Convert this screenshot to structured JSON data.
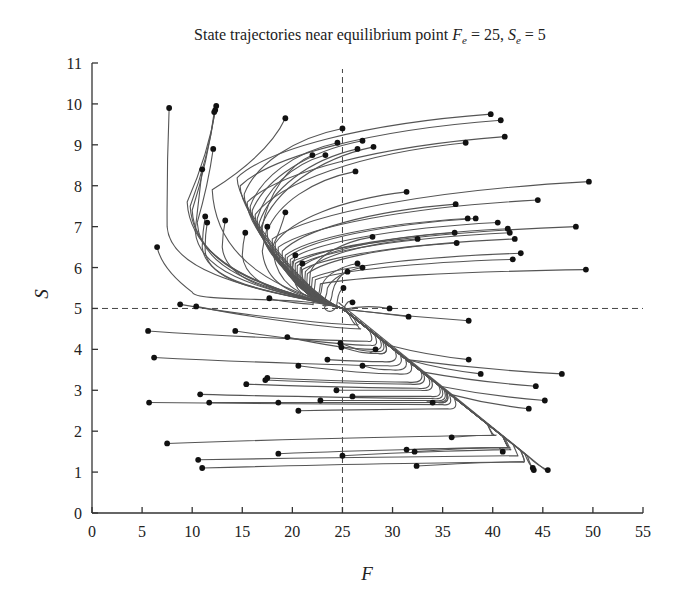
{
  "chart_data": {
    "type": "line",
    "title_parts": {
      "prefix": "State trajectories near equilibrium point ",
      "f_sym": "F",
      "f_sub": "e",
      "f_val": " = 25, ",
      "s_sym": "S",
      "s_sub": "e",
      "s_val": " = 5"
    },
    "xlabel": "F",
    "ylabel": "S",
    "xlim": [
      0,
      55
    ],
    "ylim": [
      0,
      11
    ],
    "xticks": [
      0,
      5,
      10,
      15,
      20,
      25,
      30,
      35,
      40,
      45,
      50,
      55
    ],
    "yticks": [
      0,
      1,
      2,
      3,
      4,
      5,
      6,
      7,
      8,
      9,
      10,
      11
    ],
    "grid": false,
    "legend": "none",
    "equilibrium": {
      "F": 25,
      "S": 5
    },
    "reference_lines": [
      {
        "orientation": "vertical",
        "value": 25,
        "style": "dashed"
      },
      {
        "orientation": "horizontal",
        "value": 5,
        "style": "dashed"
      }
    ],
    "trajectory_family_upper_right_start": [
      {
        "start": [
          39.8,
          9.75
        ],
        "via": [
          14.5,
          8.2
        ]
      },
      {
        "start": [
          40.8,
          9.6
        ],
        "via": [
          14.8,
          8.0
        ]
      },
      {
        "start": [
          25.0,
          9.4
        ],
        "via": [
          15.2,
          7.8
        ]
      },
      {
        "start": [
          41.2,
          9.2
        ],
        "via": [
          15.5,
          7.6
        ]
      },
      {
        "start": [
          24.5,
          9.05
        ],
        "via": [
          15.8,
          7.5
        ]
      },
      {
        "start": [
          27.0,
          9.1
        ],
        "via": [
          16.0,
          7.4
        ]
      },
      {
        "start": [
          37.3,
          9.05
        ],
        "via": [
          16.3,
          7.3
        ]
      },
      {
        "start": [
          23.3,
          8.75
        ],
        "via": [
          16.5,
          7.2
        ]
      },
      {
        "start": [
          26.5,
          8.9
        ],
        "via": [
          16.7,
          7.1
        ]
      },
      {
        "start": [
          28.1,
          8.95
        ],
        "via": [
          16.9,
          7.0
        ]
      },
      {
        "start": [
          22.0,
          8.75
        ],
        "via": [
          17.0,
          7.0
        ]
      },
      {
        "start": [
          26.3,
          8.35
        ],
        "via": [
          17.5,
          6.9
        ]
      },
      {
        "start": [
          49.6,
          8.1
        ],
        "via": [
          18.0,
          6.7
        ]
      },
      {
        "start": [
          31.4,
          7.85
        ],
        "via": [
          18.3,
          6.6
        ]
      },
      {
        "start": [
          44.5,
          7.65
        ],
        "via": [
          18.6,
          6.5
        ]
      },
      {
        "start": [
          36.3,
          7.55
        ],
        "via": [
          19.0,
          6.4
        ]
      },
      {
        "start": [
          37.5,
          7.2
        ],
        "via": [
          19.3,
          6.3
        ]
      },
      {
        "start": [
          38.3,
          7.2
        ],
        "via": [
          19.5,
          6.25
        ]
      },
      {
        "start": [
          40.5,
          7.1
        ],
        "via": [
          19.8,
          6.2
        ]
      },
      {
        "start": [
          48.3,
          7.0
        ],
        "via": [
          20.0,
          6.15
        ]
      },
      {
        "start": [
          41.5,
          6.95
        ],
        "via": [
          20.3,
          6.1
        ]
      },
      {
        "start": [
          41.7,
          6.85
        ],
        "via": [
          20.5,
          6.05
        ]
      },
      {
        "start": [
          36.2,
          6.85
        ],
        "via": [
          20.8,
          6.0
        ]
      },
      {
        "start": [
          42.2,
          6.7
        ],
        "via": [
          21.0,
          5.95
        ]
      },
      {
        "start": [
          32.5,
          6.7
        ],
        "via": [
          21.3,
          5.9
        ]
      },
      {
        "start": [
          36.4,
          6.6
        ],
        "via": [
          21.5,
          5.85
        ]
      },
      {
        "start": [
          42.8,
          6.35
        ],
        "via": [
          22.0,
          5.75
        ]
      },
      {
        "start": [
          42.0,
          6.2
        ],
        "via": [
          22.3,
          5.7
        ]
      },
      {
        "start": [
          49.3,
          5.95
        ],
        "via": [
          22.8,
          5.6
        ]
      },
      {
        "start": [
          28.0,
          6.75
        ],
        "via": [
          21.8,
          5.9
        ]
      },
      {
        "start": [
          26.5,
          6.1
        ],
        "via": [
          23.0,
          5.6
        ]
      },
      {
        "start": [
          27.0,
          6.0
        ],
        "via": [
          23.5,
          5.5
        ]
      },
      {
        "start": [
          25.5,
          5.9
        ],
        "via": [
          24.0,
          5.4
        ]
      },
      {
        "start": [
          25.1,
          5.5
        ],
        "via": [
          24.5,
          5.2
        ]
      }
    ],
    "trajectory_family_upper_left_start": [
      {
        "start": [
          7.7,
          9.9
        ],
        "via": [
          7.5,
          7.0
        ]
      },
      {
        "start": [
          12.4,
          9.95
        ],
        "via": [
          9.5,
          7.6
        ]
      },
      {
        "start": [
          12.3,
          9.85
        ],
        "via": [
          9.8,
          7.5
        ]
      },
      {
        "start": [
          12.2,
          9.8
        ],
        "via": [
          10.0,
          7.4
        ]
      },
      {
        "start": [
          19.3,
          9.65
        ],
        "via": [
          12.0,
          7.9
        ]
      },
      {
        "start": [
          12.1,
          8.9
        ],
        "via": [
          10.5,
          7.1
        ]
      },
      {
        "start": [
          11.0,
          8.4
        ],
        "via": [
          10.3,
          6.9
        ]
      },
      {
        "start": [
          11.3,
          7.25
        ],
        "via": [
          11.0,
          6.5
        ]
      },
      {
        "start": [
          11.5,
          7.1
        ],
        "via": [
          11.3,
          6.4
        ]
      },
      {
        "start": [
          13.3,
          7.15
        ],
        "via": [
          13.0,
          6.5
        ]
      },
      {
        "start": [
          15.3,
          6.85
        ],
        "via": [
          15.0,
          6.3
        ]
      },
      {
        "start": [
          17.5,
          7.0
        ],
        "via": [
          17.0,
          6.4
        ]
      },
      {
        "start": [
          19.3,
          7.35
        ],
        "via": [
          18.0,
          6.5
        ]
      },
      {
        "start": [
          20.3,
          6.3
        ],
        "via": [
          20.0,
          5.9
        ]
      },
      {
        "start": [
          21.0,
          6.1
        ],
        "via": [
          21.0,
          5.8
        ]
      },
      {
        "start": [
          6.5,
          6.5
        ],
        "via": [
          10.0,
          5.4
        ]
      },
      {
        "start": [
          17.7,
          5.25
        ],
        "via": [
          22.0,
          5.1
        ]
      }
    ],
    "trajectory_family_lower_left_start": [
      {
        "start": [
          8.8,
          5.1
        ],
        "knee": [
          26.5,
          4.6
        ]
      },
      {
        "start": [
          10.4,
          5.05
        ],
        "knee": [
          26.8,
          4.5
        ]
      },
      {
        "start": [
          5.6,
          4.45
        ],
        "knee": [
          27.5,
          4.2
        ]
      },
      {
        "start": [
          14.3,
          4.45
        ],
        "knee": [
          27.8,
          4.1
        ]
      },
      {
        "start": [
          19.5,
          4.3
        ],
        "knee": [
          28.0,
          4.0
        ]
      },
      {
        "start": [
          24.8,
          4.15
        ],
        "knee": [
          28.3,
          3.95
        ]
      },
      {
        "start": [
          24.9,
          4.05
        ],
        "knee": [
          28.5,
          3.9
        ]
      },
      {
        "start": [
          28.3,
          4.0
        ],
        "knee": [
          28.6,
          3.9
        ]
      },
      {
        "start": [
          6.2,
          3.8
        ],
        "knee": [
          29.5,
          3.6
        ]
      },
      {
        "start": [
          23.5,
          3.75
        ],
        "knee": [
          29.0,
          3.7
        ]
      },
      {
        "start": [
          20.6,
          3.6
        ],
        "knee": [
          30.5,
          3.4
        ]
      },
      {
        "start": [
          27.0,
          3.6
        ],
        "knee": [
          29.8,
          3.5
        ]
      },
      {
        "start": [
          17.5,
          3.3
        ],
        "knee": [
          31.5,
          3.2
        ]
      },
      {
        "start": [
          17.3,
          3.25
        ],
        "knee": [
          31.8,
          3.15
        ]
      },
      {
        "start": [
          15.4,
          3.15
        ],
        "knee": [
          32.5,
          3.05
        ]
      },
      {
        "start": [
          24.4,
          3.0
        ],
        "knee": [
          32.8,
          3.0
        ]
      },
      {
        "start": [
          10.8,
          2.9
        ],
        "knee": [
          34.0,
          2.8
        ]
      },
      {
        "start": [
          11.7,
          2.7
        ],
        "knee": [
          34.5,
          2.7
        ]
      },
      {
        "start": [
          5.7,
          2.7
        ],
        "knee": [
          35.0,
          2.65
        ]
      },
      {
        "start": [
          18.6,
          2.7
        ],
        "knee": [
          34.5,
          2.7
        ]
      },
      {
        "start": [
          22.8,
          2.75
        ],
        "knee": [
          34.2,
          2.75
        ]
      },
      {
        "start": [
          26.0,
          2.85
        ],
        "knee": [
          33.8,
          2.85
        ]
      },
      {
        "start": [
          34.0,
          2.7
        ],
        "knee": [
          34.3,
          2.72
        ]
      },
      {
        "start": [
          20.6,
          2.5
        ],
        "knee": [
          35.5,
          2.55
        ]
      },
      {
        "start": [
          7.5,
          1.7
        ],
        "knee": [
          40.3,
          1.9
        ]
      },
      {
        "start": [
          35.9,
          1.85
        ],
        "knee": [
          40.0,
          1.9
        ]
      },
      {
        "start": [
          18.6,
          1.45
        ],
        "knee": [
          41.7,
          1.6
        ]
      },
      {
        "start": [
          25.0,
          1.4
        ],
        "knee": [
          41.8,
          1.55
        ]
      },
      {
        "start": [
          10.6,
          1.3
        ],
        "knee": [
          42.5,
          1.4
        ]
      },
      {
        "start": [
          31.4,
          1.55
        ],
        "knee": [
          41.6,
          1.6
        ]
      },
      {
        "start": [
          32.2,
          1.5
        ],
        "knee": [
          41.6,
          1.6
        ]
      },
      {
        "start": [
          41.0,
          1.5
        ],
        "knee": [
          41.6,
          1.6
        ]
      },
      {
        "start": [
          11.0,
          1.1
        ],
        "knee": [
          43.0,
          1.25
        ]
      },
      {
        "start": [
          32.4,
          1.15
        ],
        "knee": [
          43.0,
          1.25
        ]
      }
    ],
    "trajectory_family_lower_right_start": [
      {
        "start": [
          37.6,
          4.7
        ]
      },
      {
        "start": [
          31.6,
          4.8
        ]
      },
      {
        "start": [
          29.7,
          5.0
        ]
      },
      {
        "start": [
          26.0,
          5.15
        ]
      },
      {
        "start": [
          37.6,
          3.75
        ]
      },
      {
        "start": [
          46.9,
          3.4
        ]
      },
      {
        "start": [
          38.8,
          3.4
        ]
      },
      {
        "start": [
          44.3,
          3.1
        ]
      },
      {
        "start": [
          45.2,
          2.75
        ]
      },
      {
        "start": [
          43.6,
          2.55
        ]
      },
      {
        "start": [
          44.0,
          1.1
        ]
      },
      {
        "start": [
          44.1,
          1.05
        ]
      },
      {
        "start": [
          45.5,
          1.05
        ]
      }
    ]
  }
}
